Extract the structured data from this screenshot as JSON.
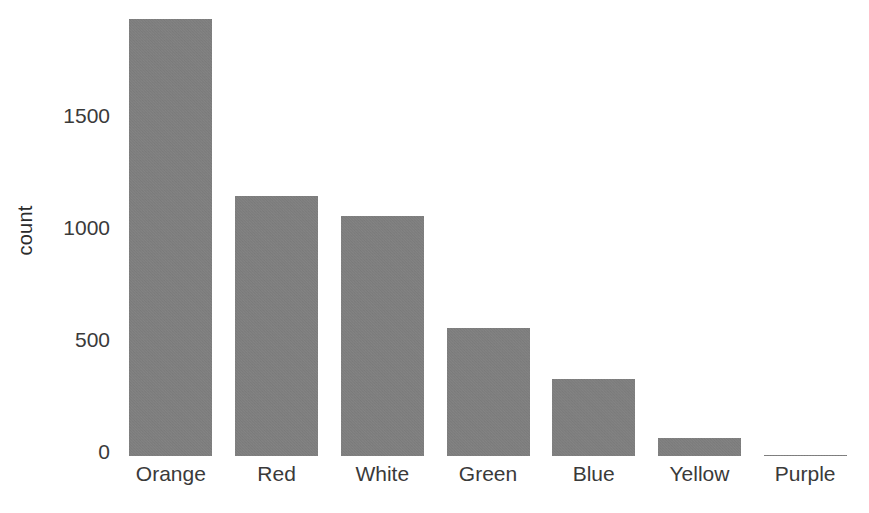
{
  "chart_data": {
    "type": "bar",
    "title": "",
    "subtitle": "",
    "xlabel": "",
    "ylabel": "count",
    "categories": [
      "Orange",
      "Red",
      "White",
      "Green",
      "Blue",
      "Yellow",
      "Purple"
    ],
    "values": [
      1950,
      1160,
      1070,
      570,
      345,
      80,
      5
    ],
    "yticks": [
      0,
      500,
      1000,
      1500
    ],
    "ytick_labels": [
      "0",
      "500",
      "1000",
      "1500"
    ],
    "ylim": [
      0,
      2000
    ],
    "grid": false,
    "legend": null,
    "bar_color": "#808080",
    "background_color": "#ffffff",
    "text_color": "#3a3a3a"
  },
  "axes": {
    "y_title": "count",
    "y_tick_labels": [
      "1500",
      "1000",
      "500",
      "0"
    ],
    "x_tick_labels": [
      "Orange",
      "Red",
      "White",
      "Green",
      "Blue",
      "Yellow",
      "Purple"
    ]
  }
}
